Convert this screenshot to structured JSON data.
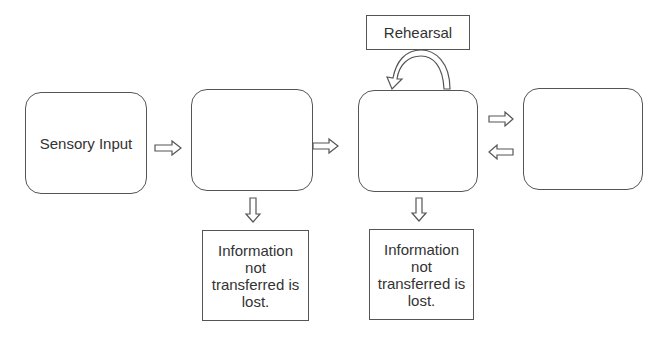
{
  "diagram": {
    "type": "memory-model-flowchart",
    "stages": [
      {
        "id": "sensory-input",
        "label": "Sensory Input"
      },
      {
        "id": "stage-2",
        "label": ""
      },
      {
        "id": "stage-3",
        "label": ""
      },
      {
        "id": "stage-4",
        "label": ""
      }
    ],
    "rehearsal": {
      "label": "Rehearsal"
    },
    "loss_notes": [
      {
        "label": "Information\nnot\ntransferred is\nlost."
      },
      {
        "label": "Information\nnot\ntransferred is\nlost."
      }
    ],
    "arrows": [
      {
        "from": "sensory-input",
        "to": "stage-2",
        "icon": "right-arrow-icon"
      },
      {
        "from": "stage-2",
        "to": "stage-3",
        "icon": "right-arrow-icon"
      },
      {
        "from": "stage-3",
        "to": "stage-4",
        "icon": "right-arrow-icon"
      },
      {
        "from": "stage-4",
        "to": "stage-3",
        "icon": "left-arrow-icon"
      },
      {
        "from": "stage-2",
        "to": "loss-note-1",
        "icon": "down-arrow-icon"
      },
      {
        "from": "stage-3",
        "to": "loss-note-2",
        "icon": "down-arrow-icon"
      },
      {
        "from": "stage-3",
        "to": "stage-3",
        "via": "rehearsal",
        "icon": "curved-loop-arrow-icon"
      }
    ]
  }
}
